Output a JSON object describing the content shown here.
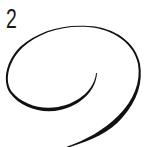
{
  "diagram": {
    "step_label": "2",
    "stroke": {
      "shape": "spiral",
      "color": "#111111",
      "direction": "starts thin at center, loops counter-clockwise outward, ends thick at bottom"
    }
  }
}
